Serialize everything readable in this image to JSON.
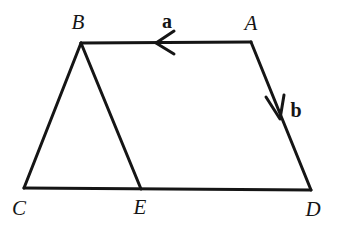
{
  "figure": {
    "background_color": "#ffffff",
    "stroke_color": "#151515",
    "stroke_width": 3,
    "width": 340,
    "height": 225,
    "points": {
      "A": {
        "x": 251,
        "y": 42
      },
      "B": {
        "x": 81,
        "y": 43
      },
      "C": {
        "x": 24,
        "y": 188
      },
      "D": {
        "x": 311,
        "y": 190
      },
      "E": {
        "x": 141,
        "y": 189
      }
    },
    "vertex_labels": [
      {
        "name": "B",
        "text": "B",
        "x": 78,
        "y": 22
      },
      {
        "name": "A",
        "text": "A",
        "x": 251,
        "y": 23
      },
      {
        "name": "C",
        "text": "C",
        "x": 19,
        "y": 208
      },
      {
        "name": "E",
        "text": "E",
        "x": 140,
        "y": 207
      },
      {
        "name": "D",
        "text": "D",
        "x": 313,
        "y": 209
      }
    ],
    "segments": [
      {
        "name": "segment-BA",
        "from": "B",
        "to": "A"
      },
      {
        "name": "segment-AD",
        "from": "A",
        "to": "D"
      },
      {
        "name": "segment-DC",
        "from": "D",
        "to": "C"
      },
      {
        "name": "segment-CB",
        "from": "C",
        "to": "B"
      },
      {
        "name": "segment-BE",
        "from": "B",
        "to": "E"
      }
    ],
    "vectors": [
      {
        "name": "a",
        "label": "a",
        "on_segment": "BA",
        "direction": "A-to-B",
        "arrow_tip": {
          "x": 156,
          "y": 43
        },
        "label_pos": {
          "x": 167,
          "y": 21
        }
      },
      {
        "name": "b",
        "label": "b",
        "on_segment": "AD",
        "direction": "A-to-D",
        "arrow_tip": {
          "x": 280,
          "y": 119
        },
        "label_pos": {
          "x": 296,
          "y": 110
        }
      }
    ]
  }
}
